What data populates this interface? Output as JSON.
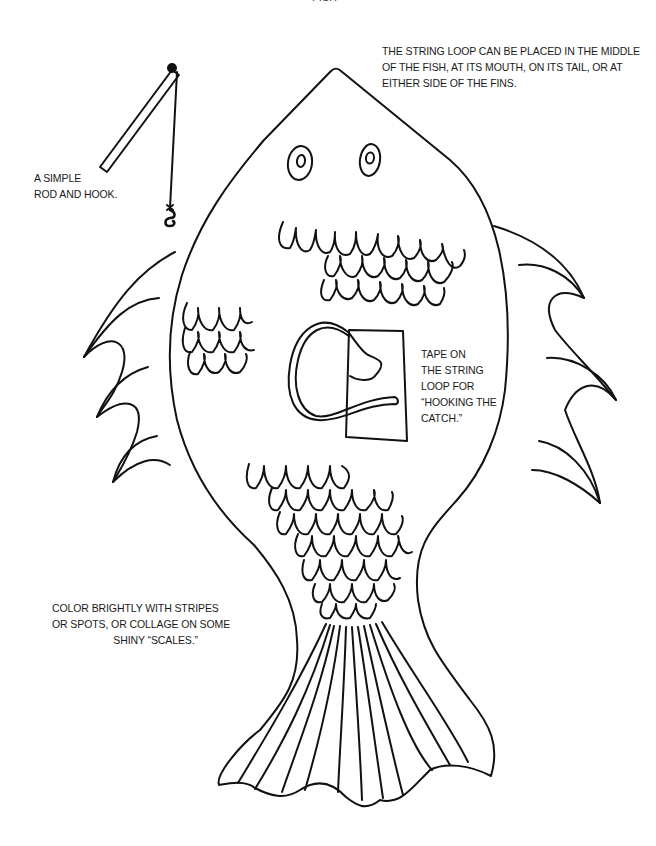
{
  "page": {
    "header_fragment": "FISH"
  },
  "captions": {
    "string_loop": {
      "lines": [
        "THE STRING LOOP CAN BE PLACED IN THE MIDDLE",
        "OF THE FISH, AT ITS MOUTH, ON ITS TAIL, OR AT",
        "EITHER SIDE OF THE FINS."
      ]
    },
    "rod": {
      "lines": [
        "A SIMPLE",
        "ROD AND HOOK."
      ]
    },
    "tape": {
      "lines": [
        "TAPE ON",
        "THE STRING",
        "LOOP FOR",
        "“HOOKING THE",
        "CATCH.”"
      ]
    },
    "color": {
      "lines": [
        "COLOR BRIGHTLY WITH STRIPES",
        "OR SPOTS, OR COLLAGE ON SOME",
        "SHINY “SCALES.”"
      ]
    }
  },
  "illustration": {
    "subject": "fish-craft-template",
    "parts": [
      "fish-body",
      "eyes",
      "scales",
      "left-fin",
      "right-fin",
      "tail",
      "string-loop",
      "tape-strip",
      "fishing-rod",
      "hook"
    ],
    "line_color": "#111111",
    "background_color": "#ffffff"
  }
}
